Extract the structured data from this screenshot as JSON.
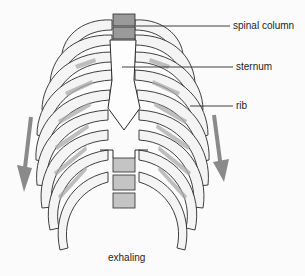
{
  "diagram": {
    "caption": "exhaling",
    "labels": [
      {
        "text": "spinal column",
        "x": 233,
        "y": 22,
        "line_from": [
          140,
          27
        ]
      },
      {
        "text": "sternum",
        "x": 236,
        "y": 62,
        "line_from": [
          120,
          67
        ]
      },
      {
        "text": "rib",
        "x": 236,
        "y": 101,
        "line_from": [
          190,
          106
        ]
      }
    ],
    "arrows": [
      {
        "side": "left",
        "direction": "down",
        "color": "#8a8a8a"
      },
      {
        "side": "right",
        "direction": "down",
        "color": "#8a8a8a"
      }
    ],
    "colors": {
      "line": "#2a2a2a",
      "shade": "#a9a9a9",
      "background": "#fbfbfb",
      "arrow": "#8a8a8a"
    }
  }
}
